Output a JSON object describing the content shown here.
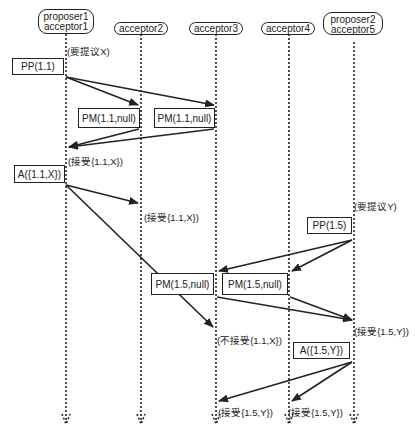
{
  "diagram": {
    "title": "",
    "type": "sequence",
    "actors": [
      {
        "line1": "proposer1",
        "line2": "acceptor1"
      },
      {
        "line1": "acceptor2",
        "line2": ""
      },
      {
        "line1": "acceptor3",
        "line2": ""
      },
      {
        "line1": "acceptor4",
        "line2": ""
      },
      {
        "line1": "proposer2",
        "line2": "acceptor5"
      }
    ],
    "boxes": {
      "pp1": "PP(1.1)",
      "pm1a": "PM(1.1,null)",
      "pm1b": "PM(1.1,null)",
      "a1": "A({1.1,X})",
      "pp2": "PP(1.5)",
      "pm2a": "PM(1.5,null)",
      "pm2b": "PM(1.5,null)",
      "a2": "A({1.5,Y})"
    },
    "notes": {
      "propose_x": "(要提议X)",
      "accept1_p1": "(接受{1.1,X})",
      "accept1_a2": "(接受{1.1,X})",
      "propose_y": "(要提议Y)",
      "reject_a3": "(不接受{1.1,X})",
      "accept2_p2": "(接受{1.5,Y})",
      "accept2_a3": "(接受{1.5,Y})",
      "accept2_a4": "(接受{1.5,Y})"
    }
  }
}
